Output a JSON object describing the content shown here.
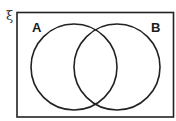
{
  "diagram": {
    "type": "venn",
    "universal_set_symbol": "ξ",
    "sets": [
      {
        "label": "A",
        "cx": 74,
        "cy": 67,
        "r": 43
      },
      {
        "label": "B",
        "cx": 117,
        "cy": 67,
        "r": 43
      }
    ],
    "frame": {
      "x": 17,
      "y": 12,
      "width": 157,
      "height": 105
    },
    "stroke_color": "#222222",
    "background_color": "#ffffff"
  }
}
